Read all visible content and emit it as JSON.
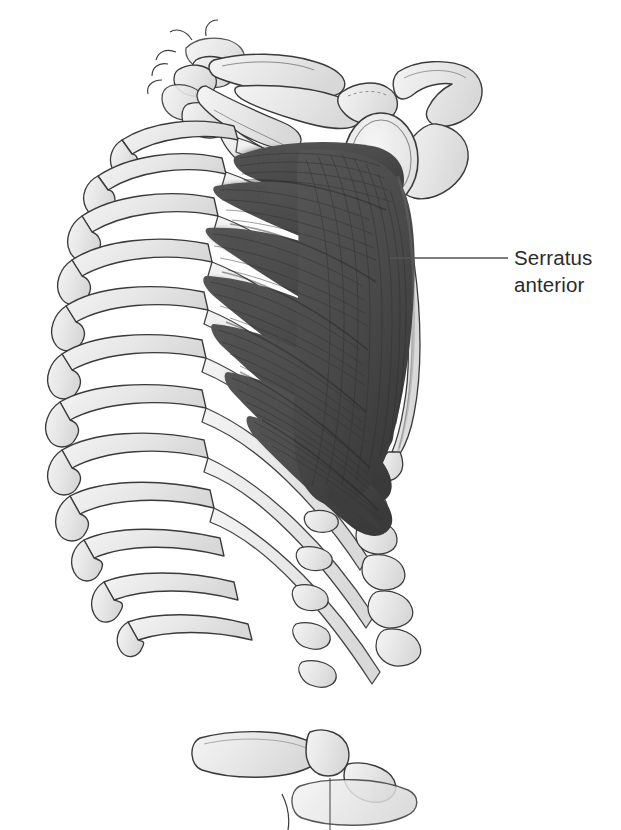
{
  "figure": {
    "kind": "anatomical-illustration",
    "background_color": "#ffffff",
    "view": "right lateral",
    "colors": {
      "background": "#ffffff",
      "bone_fill": "#e8e8e8",
      "bone_fill_light": "#f2f2f2",
      "bone_outline": "#3a3a3a",
      "cartilage_fill": "#ededed",
      "muscle_fill": "#4f4f4f",
      "muscle_fill_dark": "#3c3c3c",
      "muscle_striation": "#2e2e2e",
      "muscle_highlight": "#6a6a6a",
      "leader_line": "#555555",
      "label_text": "#2b2b2b"
    }
  },
  "labels": [
    {
      "id": "serratus-anterior",
      "line1": "Serratus",
      "line2": "anterior",
      "text_x": 514,
      "text_y": 244,
      "leader": {
        "from_x": 390,
        "from_y": 258,
        "to_x": 508,
        "to_y": 258
      }
    }
  ],
  "structures": {
    "muscle": {
      "name": "Serratus anterior",
      "digitation_count": 8,
      "description": "Fan-shaped muscle with finger-like digitations arising from ribs and converging on the medial border of the scapula"
    },
    "skeleton": {
      "ribs_anterior_count": 10,
      "ribs_posterior_count": 9,
      "scapula": [
        "acromion",
        "coracoid process",
        "glenoid cavity",
        "lateral border",
        "inferior angle"
      ],
      "clavicle": "distal clavicle",
      "vertebrae": [
        "cervical",
        "thoracic",
        "lumbar"
      ],
      "costal_cartilage": true
    }
  }
}
